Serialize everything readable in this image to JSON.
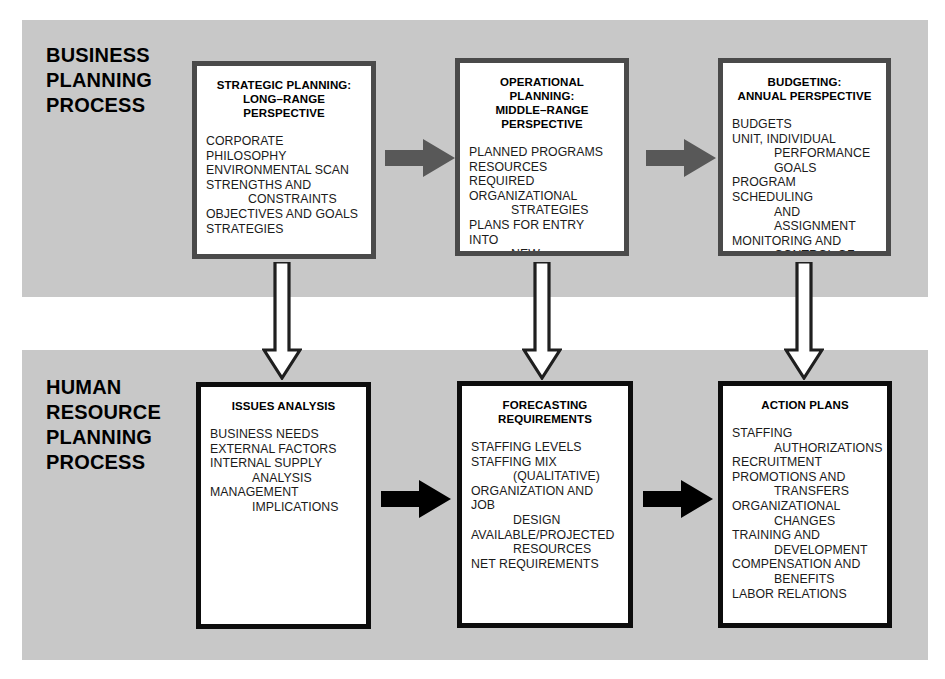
{
  "diagram": {
    "sections": [
      {
        "id": "business-planning",
        "label": "BUSINESS\nPLANNING\nPROCESS"
      },
      {
        "id": "human-resource-planning",
        "label": "HUMAN\nRESOURCE\nPLANNING\nPROCESS"
      }
    ],
    "boxes": [
      {
        "id": "strategic-planning",
        "title": "STRATEGIC PLANNING:\nLONG–RANGE\nPERSPECTIVE",
        "items": [
          {
            "text": "CORPORATE PHILOSOPHY",
            "indent": false
          },
          {
            "text": "ENVIRONMENTAL SCAN",
            "indent": false
          },
          {
            "text": "STRENGTHS AND",
            "indent": false
          },
          {
            "text": "CONSTRAINTS",
            "indent": true
          },
          {
            "text": "OBJECTIVES AND GOALS",
            "indent": false
          },
          {
            "text": "STRATEGIES",
            "indent": false
          }
        ]
      },
      {
        "id": "operational-planning",
        "title": "OPERATIONAL PLANNING:\nMIDDLE–RANGE\nPERSPECTIVE",
        "items": [
          {
            "text": "PLANNED PROGRAMS",
            "indent": false
          },
          {
            "text": "RESOURCES REQUIRED",
            "indent": false
          },
          {
            "text": "ORGANIZATIONAL",
            "indent": false
          },
          {
            "text": "STRATEGIES",
            "indent": true
          },
          {
            "text": "PLANS FOR ENTRY INTO",
            "indent": false
          },
          {
            "text": "NEW BUSINESSES,",
            "indent": true
          },
          {
            "text": "ACQUISITIONS,",
            "indent": true
          },
          {
            "text": "DIVESTITURES",
            "indent": true
          }
        ]
      },
      {
        "id": "budgeting",
        "title": "BUDGETING:\nANNUAL PERSPECTIVE",
        "items": [
          {
            "text": "BUDGETS",
            "indent": false
          },
          {
            "text": "UNIT, INDIVIDUAL",
            "indent": false
          },
          {
            "text": "PERFORMANCE",
            "indent": true
          },
          {
            "text": "GOALS",
            "indent": true
          },
          {
            "text": "PROGRAM SCHEDULING",
            "indent": false
          },
          {
            "text": "AND ASSIGNMENT",
            "indent": true
          },
          {
            "text": "MONITORING AND",
            "indent": false
          },
          {
            "text": "CONTROL OF",
            "indent": true
          },
          {
            "text": "RESULTS",
            "indent": true
          }
        ]
      },
      {
        "id": "issues-analysis",
        "title": "ISSUES ANALYSIS",
        "items": [
          {
            "text": "BUSINESS NEEDS",
            "indent": false
          },
          {
            "text": "EXTERNAL FACTORS",
            "indent": false
          },
          {
            "text": "INTERNAL SUPPLY",
            "indent": false
          },
          {
            "text": "ANALYSIS",
            "indent": true
          },
          {
            "text": "MANAGEMENT",
            "indent": false
          },
          {
            "text": "IMPLICATIONS",
            "indent": true
          }
        ]
      },
      {
        "id": "forecasting-requirements",
        "title": "FORECASTING\nREQUIREMENTS",
        "items": [
          {
            "text": "STAFFING LEVELS",
            "indent": false
          },
          {
            "text": "STAFFING MIX",
            "indent": false
          },
          {
            "text": "(QUALITATIVE)",
            "indent": true
          },
          {
            "text": "ORGANIZATION AND JOB",
            "indent": false
          },
          {
            "text": "DESIGN",
            "indent": true
          },
          {
            "text": "AVAILABLE/PROJECTED",
            "indent": false
          },
          {
            "text": "RESOURCES",
            "indent": true
          },
          {
            "text": "NET REQUIREMENTS",
            "indent": false
          }
        ]
      },
      {
        "id": "action-plans",
        "title": "ACTION PLANS",
        "items": [
          {
            "text": "STAFFING",
            "indent": false
          },
          {
            "text": "AUTHORIZATIONS",
            "indent": true
          },
          {
            "text": "RECRUITMENT",
            "indent": false
          },
          {
            "text": "PROMOTIONS AND",
            "indent": false
          },
          {
            "text": "TRANSFERS",
            "indent": true
          },
          {
            "text": "ORGANIZATIONAL",
            "indent": false
          },
          {
            "text": "CHANGES",
            "indent": true
          },
          {
            "text": "TRAINING AND",
            "indent": false
          },
          {
            "text": "DEVELOPMENT",
            "indent": true
          },
          {
            "text": "COMPENSATION AND",
            "indent": false
          },
          {
            "text": "BENEFITS",
            "indent": true
          },
          {
            "text": "LABOR RELATIONS",
            "indent": false
          }
        ]
      }
    ],
    "connectors": [
      {
        "id": "strategic-to-operational",
        "direction": "right",
        "style": "solid-gray"
      },
      {
        "id": "operational-to-budgeting",
        "direction": "right",
        "style": "solid-gray"
      },
      {
        "id": "issues-to-forecasting",
        "direction": "right",
        "style": "solid-black"
      },
      {
        "id": "forecasting-to-action",
        "direction": "right",
        "style": "solid-black"
      },
      {
        "id": "strategic-to-issues",
        "direction": "down",
        "style": "hollow-outline"
      },
      {
        "id": "operational-to-forecasting",
        "direction": "down",
        "style": "hollow-outline"
      },
      {
        "id": "budgeting-to-action",
        "direction": "down",
        "style": "hollow-outline"
      }
    ],
    "colors": {
      "band_background": "#c8c8c8",
      "page_background": "#ffffff",
      "box_fill": "#ffffff",
      "box_border_top": "#4a4a4a",
      "box_border_bottom": "#0d0d0d",
      "arrow_gray": "#585858",
      "arrow_black": "#000000",
      "text": "#000000"
    }
  }
}
